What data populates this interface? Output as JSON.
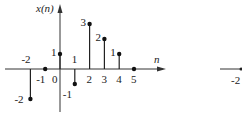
{
  "chart_data": {
    "type": "stem",
    "title": "",
    "ylabel": "x(n)",
    "xlabel": "n",
    "x": [
      -2,
      -1,
      0,
      1,
      2,
      3,
      4,
      5
    ],
    "values": [
      -2,
      0,
      1,
      -1,
      3,
      2,
      1,
      0
    ],
    "x_tick_labels": [
      "-2",
      "-1",
      "0",
      "1",
      "2",
      "3",
      "4",
      "5"
    ],
    "value_labels": [
      "-2",
      "",
      "1",
      "-1",
      "3",
      "2",
      "1",
      ""
    ],
    "grid": false,
    "xlim": [
      -3,
      6
    ],
    "ylim": [
      -2.5,
      4
    ]
  },
  "labels": {
    "y_axis": "x(n)",
    "x_axis": "n",
    "partial_right_tick": "-2"
  }
}
